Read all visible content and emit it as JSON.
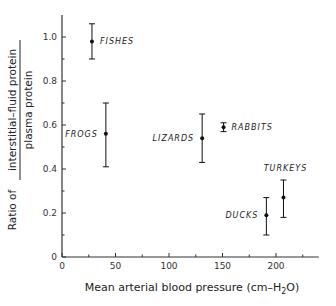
{
  "chart_data": {
    "type": "scatter",
    "title": "",
    "xlabel": "Mean arterial blood pressure (cm–H₂O)",
    "xlabel_main": "Mean arterial blood pressure (cm–H",
    "xlabel_sub": "2",
    "xlabel_end": "O)",
    "ylabel": "Ratio of interstitial-fluid protein / plasma protein",
    "ylabel_prefix": "Ratio of",
    "ylabel_numerator": "interstitial–fluid  protein",
    "ylabel_denominator": "plasma  protein",
    "xlim": [
      0,
      240
    ],
    "ylim": [
      0,
      1.1
    ],
    "xticks": [
      0,
      50,
      100,
      150,
      200
    ],
    "xtick_labels": [
      "0",
      "50",
      "100",
      "150",
      "200"
    ],
    "x_minor_ticks": [
      25,
      75,
      125,
      175,
      225
    ],
    "yticks": [
      0,
      0.2,
      0.4,
      0.6,
      0.8,
      1.0
    ],
    "ytick_labels": [
      "0",
      "0.2",
      "0.4",
      "0.6",
      "0.8",
      "1.0"
    ],
    "y_minor_ticks": [
      0.1,
      0.3,
      0.5,
      0.7,
      0.9
    ],
    "grid": false,
    "legend": null,
    "points": [
      {
        "label": "FISHES",
        "x": 28,
        "y": 0.98,
        "y_low": 0.9,
        "y_high": 1.06,
        "label_pos": "right"
      },
      {
        "label": "FROGS",
        "x": 41,
        "y": 0.56,
        "y_low": 0.41,
        "y_high": 0.7,
        "label_pos": "left"
      },
      {
        "label": "LIZARDS",
        "x": 131,
        "y": 0.54,
        "y_low": 0.43,
        "y_high": 0.65,
        "label_pos": "left"
      },
      {
        "label": "RABBITS",
        "x": 151,
        "y": 0.59,
        "y_low": 0.57,
        "y_high": 0.61,
        "label_pos": "right"
      },
      {
        "label": "DUCKS",
        "x": 191,
        "y": 0.19,
        "y_low": 0.1,
        "y_high": 0.27,
        "label_pos": "left"
      },
      {
        "label": "TURKEYS",
        "x": 207,
        "y": 0.27,
        "y_low": 0.18,
        "y_high": 0.35,
        "label_pos": "above"
      }
    ]
  },
  "colors": {
    "axis": "#333333",
    "marker": "#111111",
    "text": "#222222",
    "background": "#ffffff"
  }
}
